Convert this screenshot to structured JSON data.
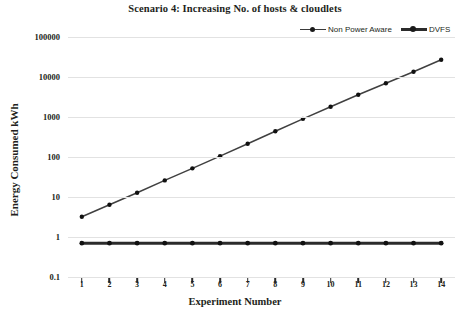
{
  "chart_data": {
    "type": "line",
    "title": "Scenario 4: Increasing No. of hosts & cloudlets",
    "xlabel": "Experiment Number",
    "ylabel": "Energy Consumed kWh",
    "yscale": "log",
    "ylim": [
      0.1,
      100000
    ],
    "ytick_labels": [
      "100000",
      "10000",
      "1000",
      "100",
      "10",
      "1",
      "0.1"
    ],
    "ytick_values": [
      100000,
      10000,
      1000,
      100,
      10,
      1,
      0.1
    ],
    "x": [
      1,
      2,
      3,
      4,
      5,
      6,
      7,
      8,
      9,
      10,
      11,
      12,
      13,
      14
    ],
    "xtick_labels": [
      "1",
      "2",
      "3",
      "4",
      "5",
      "6",
      "7",
      "8",
      "9",
      "10",
      "11",
      "12",
      "13",
      "14"
    ],
    "grid": true,
    "legend_position": "top-right",
    "series": [
      {
        "name": "Non Power Aware",
        "marker": "circle",
        "color": "#404040",
        "values": [
          3.2,
          6.4,
          12.8,
          26,
          52,
          105,
          215,
          440,
          900,
          1800,
          3600,
          7000,
          13500,
          27000
        ]
      },
      {
        "name": "DVFS",
        "marker": "circle",
        "color": "#2b2b2b",
        "values": [
          0.7,
          0.7,
          0.7,
          0.7,
          0.7,
          0.7,
          0.7,
          0.7,
          0.7,
          0.7,
          0.7,
          0.7,
          0.7,
          0.7
        ]
      }
    ]
  },
  "legend": {
    "items": [
      {
        "label": "Non Power Aware"
      },
      {
        "label": "DVFS"
      }
    ]
  }
}
